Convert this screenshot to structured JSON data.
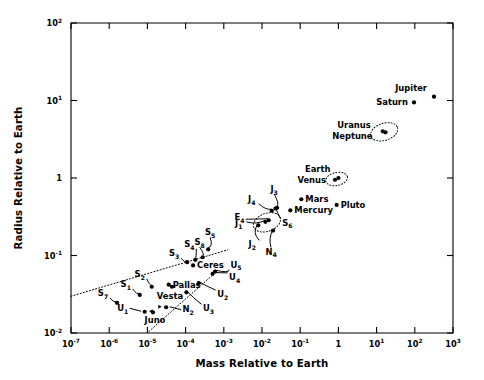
{
  "chart_data": {
    "type": "scatter",
    "title": "",
    "xlabel": "Mass Relative to Earth",
    "ylabel": "Radius Relative to Earth",
    "xscale": "log",
    "yscale": "log",
    "xlim": [
      1e-07,
      1000.0
    ],
    "ylim": [
      0.01,
      100
    ],
    "grid": false,
    "legend": "none",
    "xticklabels": [
      "10-7",
      "10-6",
      "10-5",
      "10-4",
      "10-3",
      "10-2",
      "10-1",
      "1",
      "101",
      "102",
      "103"
    ],
    "yticklabels": [
      "10-2",
      "10-1",
      "1",
      "101",
      "102"
    ],
    "xtick_bases": [
      "10",
      "10",
      "10",
      "10",
      "10",
      "10",
      "10",
      "1",
      "10",
      "10",
      "10"
    ],
    "xtick_exps": [
      "-7",
      "-6",
      "-5",
      "-4",
      "-3",
      "-2",
      "-1",
      "",
      "1",
      "2",
      "3"
    ],
    "ytick_bases": [
      "10",
      "10",
      "1",
      "10",
      "10"
    ],
    "ytick_exps": [
      "-2",
      "-1",
      "",
      "1",
      "2"
    ],
    "points": [
      {
        "name": "Jupiter",
        "base": "Jupiter",
        "sub": "",
        "x": 317.8,
        "y": 11.2,
        "label_dx": -7,
        "label_dy": -6,
        "anchor": "end",
        "leader": null
      },
      {
        "name": "Saturn",
        "base": "Saturn",
        "sub": "",
        "x": 95.2,
        "y": 9.45,
        "label_dx": -6,
        "label_dy": 2.8,
        "anchor": "end",
        "leader": null
      },
      {
        "name": "Uranus",
        "base": "Uranus",
        "sub": "",
        "x": 14.5,
        "y": 4.0,
        "label_dx": -12,
        "label_dy": -3,
        "anchor": "end",
        "leader": null
      },
      {
        "name": "Neptune",
        "base": "Neptune",
        "sub": "",
        "x": 17.1,
        "y": 3.88,
        "label_dx": -13,
        "label_dy": 7,
        "anchor": "end",
        "leader": null
      },
      {
        "name": "Earth",
        "base": "Earth",
        "sub": "",
        "x": 1.0,
        "y": 1.0,
        "label_dx": -8,
        "label_dy": -6,
        "anchor": "end",
        "leader": null
      },
      {
        "name": "Venus",
        "base": "Venus",
        "sub": "",
        "x": 0.815,
        "y": 0.95,
        "label_dx": -9,
        "label_dy": 3,
        "anchor": "end",
        "leader": null
      },
      {
        "name": "Mars",
        "base": "Mars",
        "sub": "",
        "x": 0.107,
        "y": 0.532,
        "label_dx": 4,
        "label_dy": 2.8,
        "anchor": "start",
        "leader": null
      },
      {
        "name": "Mercury",
        "base": "Mercury",
        "sub": "",
        "x": 0.0553,
        "y": 0.383,
        "label_dx": 4,
        "label_dy": 2.8,
        "anchor": "start",
        "leader": null
      },
      {
        "name": "Pluto",
        "base": "Pluto",
        "sub": "",
        "x": 0.9,
        "y": 0.45,
        "label_dx": 4,
        "label_dy": 2.8,
        "anchor": "start",
        "leader": null
      },
      {
        "name": "Ganymede",
        "base": "J",
        "sub": "3",
        "x": 0.0248,
        "y": 0.413,
        "label_dx": -3,
        "label_dy": -16,
        "anchor": "middle",
        "leader": "curve"
      },
      {
        "name": "Callisto",
        "base": "J",
        "sub": "4",
        "x": 0.018,
        "y": 0.378,
        "label_dx": -20,
        "label_dy": -9,
        "anchor": "middle",
        "leader": "curve"
      },
      {
        "name": "Moon",
        "base": "E",
        "sub": "4",
        "x": 0.0123,
        "y": 0.272,
        "label_dx": -26,
        "label_dy": -2,
        "anchor": "middle",
        "leader": "curve"
      },
      {
        "name": "Io",
        "base": "J",
        "sub": "1",
        "x": 0.015,
        "y": 0.285,
        "label_dx": -30,
        "label_dy": 6,
        "anchor": "middle",
        "leader": "curve"
      },
      {
        "name": "Europa",
        "base": "J",
        "sub": "2",
        "x": 0.008,
        "y": 0.245,
        "label_dx": -6,
        "label_dy": 22,
        "anchor": "middle",
        "leader": "curve"
      },
      {
        "name": "Titan",
        "base": "S",
        "sub": "6",
        "x": 0.0225,
        "y": 0.404,
        "label_dx": 12,
        "label_dy": 17,
        "anchor": "middle",
        "leader": "curve"
      },
      {
        "name": "Triton",
        "base": "N",
        "sub": "4",
        "x": 0.0195,
        "y": 0.21,
        "label_dx": -2,
        "label_dy": 24,
        "anchor": "middle",
        "leader": "curve"
      },
      {
        "name": "Rhea",
        "base": "S",
        "sub": "5",
        "x": 0.00039,
        "y": 0.12,
        "label_dx": 2,
        "label_dy": -14,
        "anchor": "middle",
        "leader": "curve"
      },
      {
        "name": "Dione",
        "base": "S",
        "sub": "4",
        "x": 0.00018,
        "y": 0.088,
        "label_dx": -6,
        "label_dy": -13,
        "anchor": "middle",
        "leader": "curve"
      },
      {
        "name": "Tethys",
        "base": "S",
        "sub": "3",
        "x": 0.00011,
        "y": 0.082,
        "label_dx": -13,
        "label_dy": -6,
        "anchor": "middle",
        "leader": "curve"
      },
      {
        "name": "Iapetus",
        "base": "S",
        "sub": "8",
        "x": 0.00028,
        "y": 0.095,
        "label_dx": -3,
        "label_dy": -12,
        "anchor": "middle",
        "leader": "curve"
      },
      {
        "name": "Enceladus",
        "base": "S",
        "sub": "2",
        "x": 1.3e-05,
        "y": 0.0395,
        "label_dx": -12,
        "label_dy": -10,
        "anchor": "middle",
        "leader": "curve"
      },
      {
        "name": "Mimas",
        "base": "S",
        "sub": "1",
        "x": 6.3e-06,
        "y": 0.031,
        "label_dx": -14,
        "label_dy": -8,
        "anchor": "middle",
        "leader": "curve"
      },
      {
        "name": "Hyperion",
        "base": "S",
        "sub": "7",
        "x": 1.6e-06,
        "y": 0.0245,
        "label_dx": -14,
        "label_dy": -7,
        "anchor": "middle",
        "leader": "curve"
      },
      {
        "name": "Titania",
        "base": "U",
        "sub": "5",
        "x": 0.00059,
        "y": 0.062,
        "label_dx": 21,
        "label_dy": -4,
        "anchor": "middle",
        "leader": "curve"
      },
      {
        "name": "Oberon",
        "base": "U",
        "sub": "4",
        "x": 0.00051,
        "y": 0.058,
        "label_dx": 22,
        "label_dy": 6,
        "anchor": "middle",
        "leader": "curve"
      },
      {
        "name": "Umbriel",
        "base": "U",
        "sub": "2",
        "x": 0.00022,
        "y": 0.044,
        "label_dx": 24,
        "label_dy": 14,
        "anchor": "middle",
        "leader": "curve"
      },
      {
        "name": "Ariel",
        "base": "U",
        "sub": "3",
        "x": 0.000105,
        "y": 0.0335,
        "label_dx": 22,
        "label_dy": 19,
        "anchor": "middle",
        "leader": "curve"
      },
      {
        "name": "Miranda",
        "base": "U",
        "sub": "1",
        "x": 8.5e-06,
        "y": 0.0188,
        "label_dx": -22,
        "label_dy": -1,
        "anchor": "middle",
        "leader": "arrow"
      },
      {
        "name": "Ceres",
        "base": "Ceres",
        "sub": "",
        "x": 0.000157,
        "y": 0.0745,
        "label_dx": 4,
        "label_dy": 3,
        "anchor": "start",
        "leader": null
      },
      {
        "name": "Pallas",
        "base": "Pallas",
        "sub": "",
        "x": 3.6e-05,
        "y": 0.042,
        "label_dx": 4,
        "label_dy": 3,
        "anchor": "start",
        "leader": null
      },
      {
        "name": "Vesta",
        "base": "Vesta",
        "sub": "",
        "x": 4.4e-05,
        "y": 0.0395,
        "label_dx": -2,
        "label_dy": 12,
        "anchor": "middle",
        "leader": null
      },
      {
        "name": "Juno",
        "base": "Juno",
        "sub": "",
        "x": 1.4e-05,
        "y": 0.0185,
        "label_dx": 2,
        "label_dy": 11,
        "anchor": "middle",
        "leader": null
      },
      {
        "name": "N2",
        "base": "N",
        "sub": "2",
        "x": 3.1e-05,
        "y": 0.0215,
        "label_dx": 22,
        "label_dy": 5,
        "anchor": "middle",
        "leader": "arrow"
      }
    ],
    "trend_lines": [
      {
        "name": "upper-density-line",
        "x1": 1e-07,
        "y1": 0.0298,
        "x2": 0.00125,
        "y2": 0.118
      },
      {
        "name": "lower-density-line",
        "x1": 1.1e-05,
        "y1": 0.0105,
        "x2": 0.00048,
        "y2": 0.0545
      }
    ],
    "ellipses": [
      {
        "name": "uranus-neptune-group",
        "cx": 15.8,
        "cy": 3.94,
        "rx_px": 14,
        "ry_px": 8.5,
        "rot": -18
      },
      {
        "name": "earth-venus-group",
        "cx": 0.9,
        "cy": 0.97,
        "rx_px": 11,
        "ry_px": 6.5,
        "rot": -12
      },
      {
        "name": "moon-io-group",
        "cx": 0.0135,
        "cy": 0.268,
        "rx_px": 14,
        "ry_px": 9,
        "rot": -20
      }
    ]
  }
}
